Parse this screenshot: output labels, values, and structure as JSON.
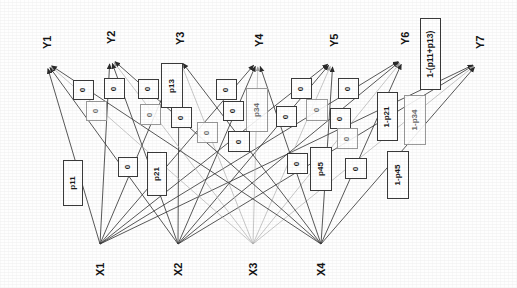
{
  "diagram": {
    "type": "bipartite-graph",
    "background_color": "#fefefe",
    "edge_color": "#3a3a3a",
    "faint_edge_color": "#b0b0b0",
    "box_border_color": "#3a3a3a",
    "text_color": "#141414"
  },
  "inputs": [
    {
      "id": "X1",
      "label": "X1",
      "x": 100,
      "y": 248
    },
    {
      "id": "X2",
      "label": "X2",
      "x": 178,
      "y": 248
    },
    {
      "id": "X3",
      "label": "X3",
      "x": 253,
      "y": 248
    },
    {
      "id": "X4",
      "label": "X4",
      "x": 321,
      "y": 248
    }
  ],
  "outputs": [
    {
      "id": "Y1",
      "label": "Y1",
      "x": 46,
      "y": 62
    },
    {
      "id": "Y2",
      "label": "Y2",
      "x": 110,
      "y": 57
    },
    {
      "id": "Y3",
      "label": "Y3",
      "x": 179,
      "y": 58
    },
    {
      "id": "Y4",
      "label": "Y4",
      "x": 258,
      "y": 60
    },
    {
      "id": "Y5",
      "label": "Y5",
      "x": 333,
      "y": 60
    },
    {
      "id": "Y6",
      "label": "Y6",
      "x": 404,
      "y": 58
    },
    {
      "id": "Y7",
      "label": "Y7",
      "x": 479,
      "y": 62
    }
  ],
  "edge_labels": [
    {
      "id": "b-p11",
      "text": "p11",
      "x": 63,
      "y": 160,
      "w": 20,
      "h": 46,
      "faint": false,
      "big": false
    },
    {
      "id": "b-0-a",
      "text": "0",
      "x": 73,
      "y": 80,
      "w": 21,
      "h": 20,
      "faint": false,
      "big": false
    },
    {
      "id": "b-0-b",
      "text": "0",
      "x": 86,
      "y": 101,
      "w": 21,
      "h": 20,
      "faint": true,
      "big": false
    },
    {
      "id": "b-0-c",
      "text": "0",
      "x": 104,
      "y": 78,
      "w": 21,
      "h": 21,
      "faint": false,
      "big": false
    },
    {
      "id": "b-0-d",
      "text": "0",
      "x": 118,
      "y": 157,
      "w": 20,
      "h": 20,
      "faint": false,
      "big": false
    },
    {
      "id": "b-0-e",
      "text": "0",
      "x": 138,
      "y": 79,
      "w": 21,
      "h": 20,
      "faint": false,
      "big": false
    },
    {
      "id": "b-0-f",
      "text": "0",
      "x": 140,
      "y": 104,
      "w": 21,
      "h": 21,
      "faint": true,
      "big": false
    },
    {
      "id": "b-p13",
      "text": "p13",
      "x": 161,
      "y": 63,
      "w": 22,
      "h": 45,
      "faint": false,
      "big": false
    },
    {
      "id": "b-0-g",
      "text": "0",
      "x": 171,
      "y": 107,
      "w": 21,
      "h": 21,
      "faint": false,
      "big": false
    },
    {
      "id": "b-p21",
      "text": "p21",
      "x": 147,
      "y": 152,
      "w": 20,
      "h": 44,
      "faint": false,
      "big": false
    },
    {
      "id": "b-0-h",
      "text": "0",
      "x": 216,
      "y": 79,
      "w": 21,
      "h": 21,
      "faint": false,
      "big": false
    },
    {
      "id": "b-0-i",
      "text": "0",
      "x": 223,
      "y": 101,
      "w": 21,
      "h": 20,
      "faint": false,
      "big": false
    },
    {
      "id": "b-p34",
      "text": "p34",
      "x": 246,
      "y": 88,
      "w": 22,
      "h": 44,
      "faint": true,
      "big": false
    },
    {
      "id": "b-0-j",
      "text": "0",
      "x": 197,
      "y": 122,
      "w": 21,
      "h": 21,
      "faint": true,
      "big": false
    },
    {
      "id": "b-0-k",
      "text": "0",
      "x": 228,
      "y": 131,
      "w": 22,
      "h": 21,
      "faint": false,
      "big": false
    },
    {
      "id": "b-0-l",
      "text": "0",
      "x": 291,
      "y": 78,
      "w": 21,
      "h": 21,
      "faint": false,
      "big": false
    },
    {
      "id": "b-0-m",
      "text": "0",
      "x": 276,
      "y": 106,
      "w": 21,
      "h": 21,
      "faint": false,
      "big": false
    },
    {
      "id": "b-0-n",
      "text": "0",
      "x": 306,
      "y": 99,
      "w": 22,
      "h": 22,
      "faint": true,
      "big": false
    },
    {
      "id": "b-0-o",
      "text": "0",
      "x": 338,
      "y": 78,
      "w": 21,
      "h": 21,
      "faint": false,
      "big": false
    },
    {
      "id": "b-0-p",
      "text": "0",
      "x": 330,
      "y": 108,
      "w": 21,
      "h": 21,
      "faint": false,
      "big": false
    },
    {
      "id": "b-0-q",
      "text": "0",
      "x": 337,
      "y": 128,
      "w": 21,
      "h": 21,
      "faint": true,
      "big": false
    },
    {
      "id": "b-0-r",
      "text": "0",
      "x": 287,
      "y": 153,
      "w": 21,
      "h": 21,
      "faint": false,
      "big": false
    },
    {
      "id": "b-p45",
      "text": "p45",
      "x": 310,
      "y": 147,
      "w": 22,
      "h": 44,
      "faint": false,
      "big": false
    },
    {
      "id": "b-0-s",
      "text": "0",
      "x": 345,
      "y": 158,
      "w": 22,
      "h": 21,
      "faint": false,
      "big": false
    },
    {
      "id": "b-1p21",
      "text": "1-p21",
      "x": 377,
      "y": 92,
      "w": 21,
      "h": 49,
      "faint": false,
      "big": false
    },
    {
      "id": "b-1p34",
      "text": "1-p34",
      "x": 404,
      "y": 95,
      "w": 22,
      "h": 50,
      "faint": true,
      "big": false
    },
    {
      "id": "b-1p45",
      "text": "1-p45",
      "x": 387,
      "y": 151,
      "w": 22,
      "h": 48,
      "faint": false,
      "big": false
    },
    {
      "id": "b-1p11p13",
      "text": "1-(p11+p13)",
      "x": 420,
      "y": 18,
      "w": 21,
      "h": 72,
      "faint": false,
      "big": true
    }
  ],
  "edges": [
    {
      "from": "X1",
      "to": "Y1",
      "faint": false
    },
    {
      "from": "X1",
      "to": "Y2",
      "faint": false
    },
    {
      "from": "X1",
      "to": "Y3",
      "faint": false
    },
    {
      "from": "X1",
      "to": "Y4",
      "faint": false
    },
    {
      "from": "X1",
      "to": "Y5",
      "faint": false
    },
    {
      "from": "X1",
      "to": "Y6",
      "faint": false
    },
    {
      "from": "X1",
      "to": "Y7",
      "faint": false
    },
    {
      "from": "X2",
      "to": "Y1",
      "faint": false
    },
    {
      "from": "X2",
      "to": "Y2",
      "faint": false
    },
    {
      "from": "X2",
      "to": "Y3",
      "faint": false
    },
    {
      "from": "X2",
      "to": "Y4",
      "faint": false
    },
    {
      "from": "X2",
      "to": "Y5",
      "faint": false
    },
    {
      "from": "X2",
      "to": "Y6",
      "faint": false
    },
    {
      "from": "X2",
      "to": "Y7",
      "faint": false
    },
    {
      "from": "X3",
      "to": "Y1",
      "faint": true
    },
    {
      "from": "X3",
      "to": "Y2",
      "faint": true
    },
    {
      "from": "X3",
      "to": "Y3",
      "faint": true
    },
    {
      "from": "X3",
      "to": "Y4",
      "faint": true
    },
    {
      "from": "X3",
      "to": "Y5",
      "faint": true
    },
    {
      "from": "X3",
      "to": "Y6",
      "faint": true
    },
    {
      "from": "X3",
      "to": "Y7",
      "faint": true
    },
    {
      "from": "X4",
      "to": "Y1",
      "faint": false
    },
    {
      "from": "X4",
      "to": "Y2",
      "faint": false
    },
    {
      "from": "X4",
      "to": "Y3",
      "faint": false
    },
    {
      "from": "X4",
      "to": "Y4",
      "faint": false
    },
    {
      "from": "X4",
      "to": "Y5",
      "faint": false
    },
    {
      "from": "X4",
      "to": "Y6",
      "faint": false
    },
    {
      "from": "X4",
      "to": "Y7",
      "faint": false
    }
  ]
}
